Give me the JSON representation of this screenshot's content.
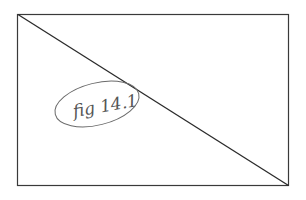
{
  "figure": {
    "label": "fig 14.1",
    "colors": {
      "background": "#ffffff",
      "frame_stroke": "#3a3a3a",
      "diagonal_stroke": "#2a2a2a",
      "label_stroke": "#555555",
      "ellipse_stroke": "#6a6a6a"
    }
  }
}
